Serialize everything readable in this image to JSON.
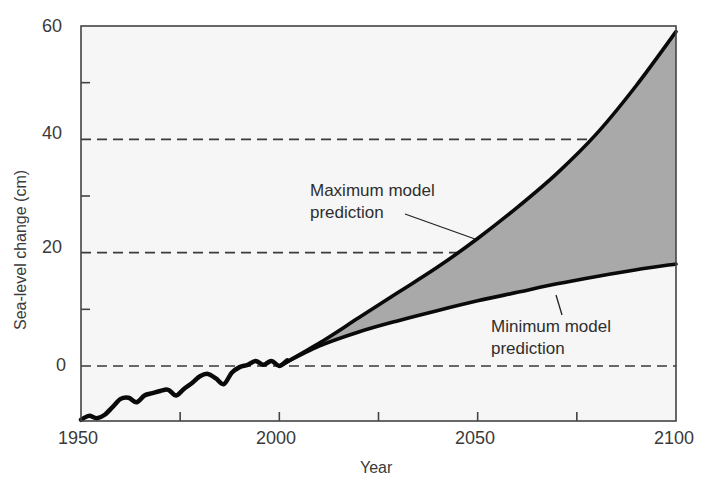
{
  "chart_data": {
    "type": "line",
    "title": "",
    "xlabel": "Year",
    "ylabel": "Sea-level change (cm)",
    "xlim": [
      1950,
      2100
    ],
    "ylim": [
      -10,
      60
    ],
    "x_ticks": [
      1950,
      2000,
      2050,
      2100
    ],
    "x_minor_ticks": [
      1975,
      2025,
      2075
    ],
    "y_ticks": [
      0,
      20,
      40,
      60
    ],
    "y_minor_ticks": [
      10,
      30,
      50
    ],
    "gridlines": {
      "dashed_horizontal_at": [
        0,
        20,
        40
      ]
    },
    "series": [
      {
        "name": "Observed",
        "x": [
          1950,
          1952,
          1954,
          1956,
          1958,
          1960,
          1962,
          1964,
          1966,
          1968,
          1970,
          1972,
          1974,
          1976,
          1978,
          1980,
          1982,
          1984,
          1986,
          1988,
          1990,
          1992,
          1994,
          1996,
          1998,
          2000,
          2002
        ],
        "values": [
          -9.5,
          -8.8,
          -9.2,
          -8.6,
          -7.2,
          -5.8,
          -5.6,
          -6.4,
          -5.2,
          -4.8,
          -4.4,
          -4.2,
          -5.2,
          -4.0,
          -3.0,
          -1.8,
          -1.4,
          -2.2,
          -3.2,
          -1.2,
          -0.2,
          0.2,
          0.9,
          0.2,
          0.9,
          0.0,
          1.0
        ]
      },
      {
        "name": "Maximum model prediction",
        "x": [
          2000,
          2010,
          2020,
          2030,
          2040,
          2050,
          2060,
          2070,
          2080,
          2090,
          2100
        ],
        "values": [
          0,
          4,
          8.5,
          13,
          17.5,
          22.5,
          28,
          34,
          41,
          49.5,
          59
        ]
      },
      {
        "name": "Minimum model prediction",
        "x": [
          2000,
          2010,
          2020,
          2030,
          2040,
          2050,
          2060,
          2070,
          2080,
          2090,
          2100
        ],
        "values": [
          0,
          3.5,
          6,
          8,
          9.8,
          11.5,
          13,
          14.5,
          15.8,
          17,
          18
        ]
      }
    ],
    "shaded_region": {
      "between": [
        "Minimum model prediction",
        "Maximum model prediction"
      ],
      "color": "#a9a9a9"
    },
    "annotations": [
      {
        "text": "Maximum model prediction",
        "points_to": [
          2050,
          22
        ]
      },
      {
        "text": "Minimum model prediction",
        "points_to": [
          2060,
          13
        ]
      }
    ],
    "legend": "none"
  },
  "labels": {
    "y_ticks": [
      "60",
      "40",
      "20",
      "0"
    ],
    "x_ticks": [
      "1950",
      "2000",
      "2050",
      "2100"
    ],
    "xlabel": "Year",
    "ylabel": "Sea-level change (cm)",
    "max_annot_line1": "Maximum model",
    "max_annot_line2": "prediction",
    "min_annot_line1": "Minimum model",
    "min_annot_line2": "prediction"
  },
  "colors": {
    "line": "#0a0a0a",
    "shade": "#a9a9a9",
    "plot_bg": "#f6f6f6",
    "axis": "#444444"
  }
}
